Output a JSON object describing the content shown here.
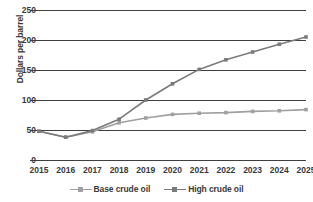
{
  "chart_data": {
    "type": "line",
    "title": "",
    "xlabel": "",
    "ylabel": "Dollars per barrel",
    "categories": [
      "2015",
      "2016",
      "2017",
      "2018",
      "2019",
      "2020",
      "2021",
      "2022",
      "2023",
      "2024",
      "2025"
    ],
    "yticks": [
      "0",
      "50",
      "100",
      "150",
      "200",
      "250"
    ],
    "ylim": [
      0,
      250
    ],
    "grid": "horizontal",
    "legend_position": "bottom-center",
    "series": [
      {
        "name": "Base crude oil",
        "color": "#a0a0a0",
        "values": [
          48,
          38,
          47,
          62,
          70,
          76,
          78,
          79,
          81,
          82,
          84
        ]
      },
      {
        "name": "High crude oil",
        "color": "#7b7b7b",
        "values": [
          48,
          38,
          49,
          68,
          100,
          127,
          151,
          167,
          180,
          193,
          205
        ]
      }
    ]
  },
  "style": {
    "grid_color": "#3f3f3f",
    "text_color": "#3a3a3a",
    "background": "#ffffff"
  }
}
